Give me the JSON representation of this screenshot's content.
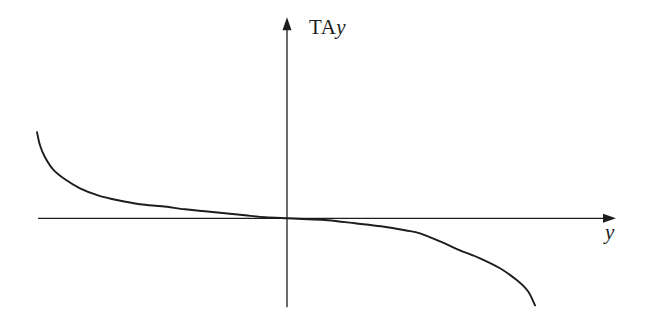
{
  "figure": {
    "background": "#ffffff",
    "line_color": "#1d1d1d"
  },
  "labels": {
    "y_axis": {
      "roman": "TA",
      "italic": "y"
    },
    "x_axis": "y"
  },
  "chart_data": {
    "type": "line",
    "title": "",
    "xlabel": "y",
    "ylabel": "TAy",
    "xlim": [
      -2.49,
      3.29
    ],
    "ylim": [
      -0.89,
      2.01
    ],
    "grid": false,
    "legend": false,
    "axis_arrows": true,
    "tick_labels": [],
    "series": [
      {
        "name": "TAy-vs-y curve",
        "x": [
          -2.5,
          -2.47,
          -2.42,
          -2.34,
          -2.22,
          -2.07,
          -1.89,
          -1.69,
          -1.47,
          -1.25,
          -1.02,
          -0.82,
          -0.62,
          -0.42,
          -0.22,
          0.0,
          0.21,
          0.41,
          0.68,
          0.94,
          1.18,
          1.33,
          1.53,
          1.73,
          1.93,
          2.13,
          2.3,
          2.41,
          2.48
        ],
        "y": [
          0.86,
          0.73,
          0.61,
          0.49,
          0.39,
          0.3,
          0.23,
          0.18,
          0.14,
          0.12,
          0.09,
          0.07,
          0.05,
          0.03,
          0.01,
          0.0,
          -0.01,
          -0.02,
          -0.05,
          -0.08,
          -0.12,
          -0.15,
          -0.23,
          -0.32,
          -0.4,
          -0.5,
          -0.62,
          -0.73,
          -0.87
        ]
      }
    ]
  }
}
